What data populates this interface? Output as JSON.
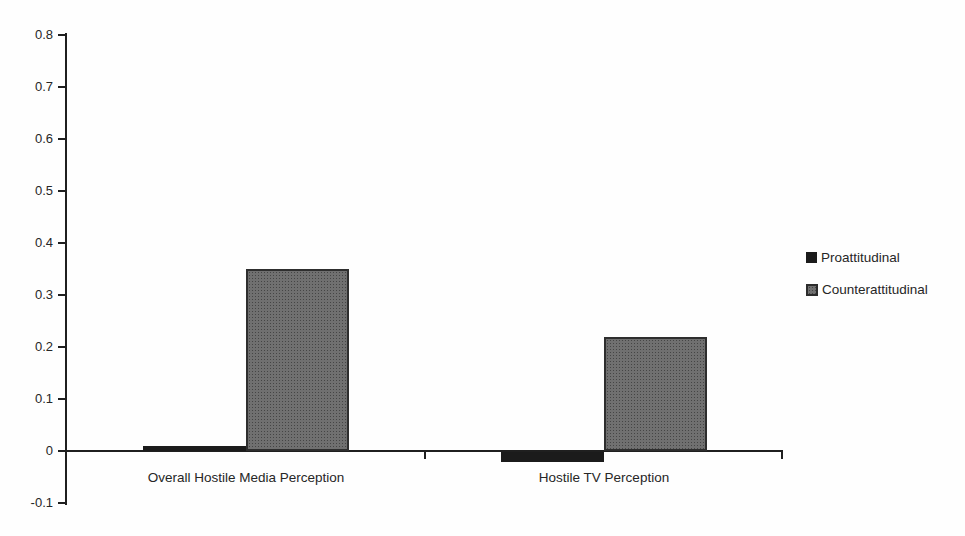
{
  "chart_data": {
    "type": "bar",
    "categories": [
      "Overall Hostile Media Perception",
      "Hostile TV Perception"
    ],
    "series": [
      {
        "name": "Proattitudinal",
        "color": "#1b1b1b",
        "values": [
          0.01,
          -0.02
        ]
      },
      {
        "name": "Counterattitudinal",
        "color": "#707070",
        "values": [
          0.35,
          0.22
        ]
      }
    ],
    "title": "",
    "xlabel": "",
    "ylabel": "",
    "ylim": [
      -0.1,
      0.8
    ],
    "ytick_step": 0.1,
    "ytick_labels": [
      "0.8",
      "0.7",
      "0.6",
      "0.5",
      "0.4",
      "0.3",
      "0.2",
      "0.1",
      "0",
      "-0.1"
    ],
    "grid": false,
    "legend_position": "right",
    "axis_color": "#1f1f1f",
    "text_color": "#262626",
    "background_color": "#fefefe"
  }
}
